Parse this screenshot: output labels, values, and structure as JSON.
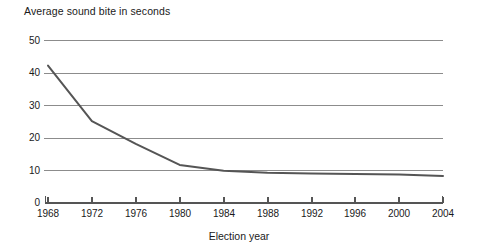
{
  "chart_data": {
    "type": "line",
    "title": "Average sound bite in seconds",
    "xlabel": "Election year",
    "ylabel": "",
    "x": [
      1968,
      1972,
      1976,
      1980,
      1984,
      1988,
      1992,
      1996,
      2000,
      2004
    ],
    "values": [
      42.3,
      25.2,
      18.2,
      11.7,
      9.9,
      9.3,
      9.1,
      8.9,
      8.8,
      8.3
    ],
    "categories": [
      "1968",
      "1972",
      "1976",
      "1980",
      "1984",
      "1988",
      "1992",
      "1996",
      "2000",
      "2004"
    ],
    "series": [
      {
        "name": "Average sound bite in seconds",
        "values": [
          42.3,
          25.2,
          18.2,
          11.7,
          9.9,
          9.3,
          9.1,
          8.9,
          8.8,
          8.3
        ]
      }
    ],
    "xlim": [
      1968,
      2004
    ],
    "ylim": [
      0,
      50
    ],
    "xticks": [
      "1968",
      "1972",
      "1976",
      "1980",
      "1984",
      "1988",
      "1992",
      "1996",
      "2000",
      "2004"
    ],
    "yticks": [
      "0",
      "10",
      "20",
      "30",
      "40",
      "50"
    ],
    "grid": "horizontal",
    "legend": "none",
    "colors": {
      "line": "#555555",
      "grid": "#8c8c8c",
      "axis": "#555555",
      "text": "#1a1a1a",
      "background": "#ffffff"
    }
  },
  "axis": {
    "y_labels": [
      "50",
      "40",
      "30",
      "20",
      "10",
      "0"
    ],
    "x_labels": [
      "1968",
      "1972",
      "1976",
      "1980",
      "1984",
      "1988",
      "1992",
      "1996",
      "2000",
      "2004"
    ],
    "x_title": "Election year"
  },
  "title": {
    "text": "Average sound bite in seconds"
  }
}
